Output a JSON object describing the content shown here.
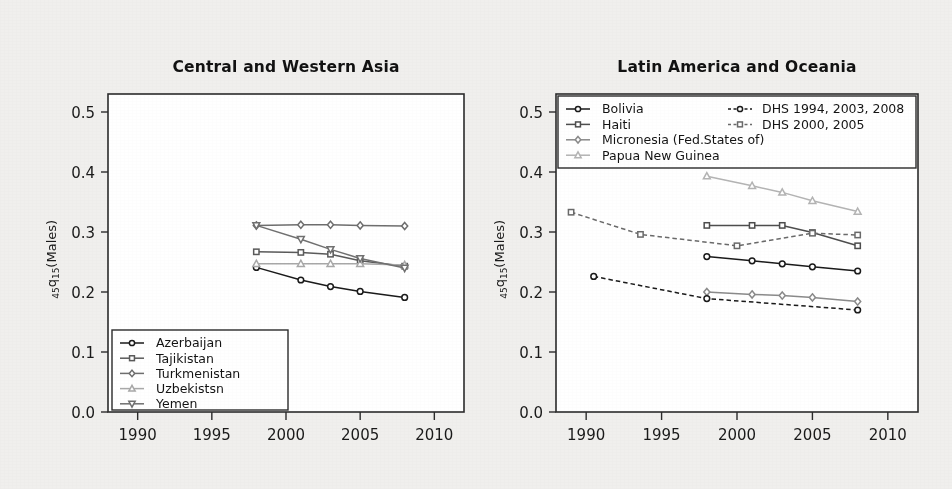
{
  "figure": {
    "width": 952,
    "height": 489,
    "background": "#f0efed",
    "ylabel_main": "q",
    "ylabel_pre": "45",
    "ylabel_post": "15",
    "ylabel_tail": "(Males)"
  },
  "chart_data": [
    {
      "type": "line",
      "id": "central-western-asia",
      "title": "Central and Western Asia",
      "xlabel": "",
      "ylabel": "45q15(Males)",
      "xlim": [
        1988,
        2012
      ],
      "ylim": [
        0.0,
        0.53
      ],
      "xticks": [
        1990,
        1995,
        2000,
        2005,
        2010
      ],
      "yticks": [
        0.0,
        0.1,
        0.2,
        0.3,
        0.4,
        0.5
      ],
      "xtick_labels": [
        "1990",
        "1995",
        "2000",
        "2005",
        "2010"
      ],
      "ytick_labels": [
        "0.0",
        "0.1",
        "0.2",
        "0.3",
        "0.4",
        "0.5"
      ],
      "grid": false,
      "legend_position": "lower-left",
      "series": [
        {
          "name": "Azerbaijan",
          "marker": "circle",
          "color": "#1a1a1a",
          "dash": "solid",
          "x": [
            1998,
            2001,
            2003,
            2005,
            2008
          ],
          "y": [
            0.241,
            0.22,
            0.209,
            0.201,
            0.191
          ]
        },
        {
          "name": "Tajikistan",
          "marker": "square",
          "color": "#5a5a5a",
          "dash": "solid",
          "x": [
            1998,
            2001,
            2003,
            2005,
            2008
          ],
          "y": [
            0.267,
            0.266,
            0.263,
            0.252,
            0.243
          ]
        },
        {
          "name": "Turkmenistan",
          "marker": "diamond",
          "color": "#6e6e6e",
          "dash": "solid",
          "x": [
            1998,
            2001,
            2003,
            2005,
            2008
          ],
          "y": [
            0.311,
            0.312,
            0.312,
            0.311,
            0.31
          ]
        },
        {
          "name": "Uzbekistsn",
          "marker": "triangle-up",
          "color": "#a8a8a8",
          "dash": "solid",
          "x": [
            1998,
            2001,
            2003,
            2005,
            2008
          ],
          "y": [
            0.247,
            0.247,
            0.247,
            0.247,
            0.245
          ]
        },
        {
          "name": "Yemen",
          "marker": "triangle-down",
          "color": "#707070",
          "dash": "solid",
          "x": [
            1998,
            2001,
            2003,
            2005,
            2008
          ],
          "y": [
            0.311,
            0.288,
            0.271,
            0.256,
            0.24
          ]
        }
      ]
    },
    {
      "type": "line",
      "id": "latin-america-oceania",
      "title": "Latin America and Oceania",
      "xlabel": "",
      "ylabel": "45q15(Males)",
      "xlim": [
        1988,
        2012
      ],
      "ylim": [
        0.0,
        0.53
      ],
      "xticks": [
        1990,
        1995,
        2000,
        2005,
        2010
      ],
      "yticks": [
        0.0,
        0.1,
        0.2,
        0.3,
        0.4,
        0.5
      ],
      "xtick_labels": [
        "1990",
        "1995",
        "2000",
        "2005",
        "2010"
      ],
      "ytick_labels": [
        "0.0",
        "0.1",
        "0.2",
        "0.3",
        "0.4",
        "0.5"
      ],
      "grid": false,
      "legend_position": "upper-inside",
      "series": [
        {
          "name": "Bolivia",
          "marker": "circle",
          "color": "#1a1a1a",
          "dash": "solid",
          "x": [
            1998,
            2001,
            2003,
            2005,
            2008
          ],
          "y": [
            0.259,
            0.252,
            0.247,
            0.242,
            0.235
          ]
        },
        {
          "name": "Haiti",
          "marker": "square",
          "color": "#4d4d4d",
          "dash": "solid",
          "x": [
            1998,
            2001,
            2003,
            2005,
            2008
          ],
          "y": [
            0.311,
            0.311,
            0.311,
            0.299,
            0.277
          ]
        },
        {
          "name": "Micronesia (Fed.States of)",
          "marker": "diamond",
          "color": "#8a8a8a",
          "dash": "solid",
          "x": [
            1998,
            2001,
            2003,
            2005,
            2008
          ],
          "y": [
            0.2,
            0.196,
            0.194,
            0.191,
            0.184
          ]
        },
        {
          "name": "Papua New Guinea",
          "marker": "triangle-up",
          "color": "#b4b4b4",
          "dash": "solid",
          "x": [
            1998,
            2001,
            2003,
            2005,
            2008
          ],
          "y": [
            0.393,
            0.377,
            0.366,
            0.352,
            0.334
          ]
        },
        {
          "name": "DHS 1994, 2003, 2008",
          "marker": "circle",
          "color": "#1a1a1a",
          "dash": "dashed",
          "x": [
            1990.5,
            1998,
            2008
          ],
          "y": [
            0.226,
            0.189,
            0.17
          ]
        },
        {
          "name": "DHS 2000, 2005",
          "marker": "square",
          "color": "#6a6a6a",
          "dash": "dashed",
          "x": [
            1989,
            1993.6,
            2000,
            2005,
            2008
          ],
          "y": [
            0.333,
            0.296,
            0.277,
            0.298,
            0.295
          ]
        }
      ],
      "legend_left": [
        {
          "label": "Bolivia",
          "marker": "circle",
          "color": "#1a1a1a",
          "dash": "solid"
        },
        {
          "label": "Haiti",
          "marker": "square",
          "color": "#4d4d4d",
          "dash": "solid"
        },
        {
          "label": "Micronesia (Fed.States of)",
          "marker": "diamond",
          "color": "#8a8a8a",
          "dash": "solid"
        },
        {
          "label": "Papua New Guinea",
          "marker": "triangle-up",
          "color": "#b4b4b4",
          "dash": "solid"
        }
      ],
      "legend_right": [
        {
          "label": "DHS 1994, 2003, 2008",
          "marker": "circle",
          "color": "#1a1a1a",
          "dash": "dashed"
        },
        {
          "label": "DHS 2000, 2005",
          "marker": "square",
          "color": "#6a6a6a",
          "dash": "dashed"
        }
      ]
    }
  ]
}
